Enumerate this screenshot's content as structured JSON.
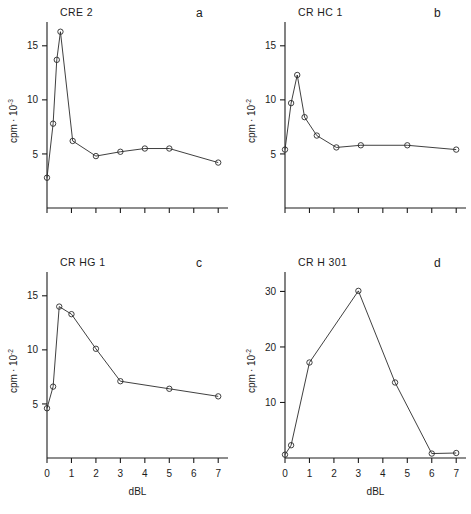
{
  "figure": {
    "background": "#ffffff",
    "ink": "#1c1c1c"
  },
  "panels": {
    "a": {
      "letter": "a",
      "title": "CRE 2",
      "ylabel_base": "cpm",
      "ylabel_mid": "· 10",
      "ylabel_exp": "-3",
      "xlabel": "",
      "yticks": [
        "5",
        "10",
        "15"
      ],
      "xticks": [
        "",
        "",
        "",
        "",
        "",
        "",
        "",
        ""
      ]
    },
    "b": {
      "letter": "b",
      "title": "CR HC 1",
      "ylabel_base": "cpm",
      "ylabel_mid": "· 10",
      "ylabel_exp": "-2",
      "xlabel": "",
      "yticks": [
        "5",
        "10",
        "15"
      ],
      "xticks": [
        "",
        "",
        "",
        "",
        "",
        "",
        "",
        ""
      ]
    },
    "c": {
      "letter": "c",
      "title": "CR HG 1",
      "ylabel_base": "cpm",
      "ylabel_mid": "· 10",
      "ylabel_exp": "-2",
      "xlabel": "dBL",
      "yticks": [
        "5",
        "10",
        "15"
      ],
      "xticks": [
        "0",
        "1",
        "2",
        "3",
        "4",
        "5",
        "6",
        "7"
      ]
    },
    "d": {
      "letter": "d",
      "title": "CR H 301",
      "ylabel_base": "cpm",
      "ylabel_mid": "· 10",
      "ylabel_exp": "-2",
      "xlabel": "dBL",
      "yticks": [
        "10",
        "20",
        "30"
      ],
      "xticks": [
        "0",
        "1",
        "2",
        "3",
        "4",
        "5",
        "6",
        "7"
      ]
    }
  },
  "chart_data": [
    {
      "type": "line",
      "panel": "a",
      "title": "CRE 2",
      "xlabel": "dBL",
      "ylabel": "cpm · 10^-3",
      "xlim": [
        0,
        7.4
      ],
      "ylim": [
        0,
        17.2
      ],
      "yticks": [
        5,
        10,
        15
      ],
      "xticks": [
        0,
        1,
        2,
        3,
        4,
        5,
        6,
        7
      ],
      "xtick_labels_shown": false,
      "grid": false,
      "legend": null,
      "markers": "open-circle",
      "x": [
        0,
        0.25,
        0.4,
        0.55,
        1.05,
        2.0,
        3.0,
        4.0,
        5.0,
        7.0
      ],
      "y": [
        2.8,
        7.8,
        13.7,
        16.3,
        6.2,
        4.8,
        5.2,
        5.5,
        5.5,
        4.2
      ]
    },
    {
      "type": "line",
      "panel": "b",
      "title": "CR HC 1",
      "xlabel": "dBL",
      "ylabel": "cpm · 10^-2",
      "xlim": [
        0,
        7.4
      ],
      "ylim": [
        0,
        17.2
      ],
      "yticks": [
        5,
        10,
        15
      ],
      "xticks": [
        0,
        1,
        2,
        3,
        4,
        5,
        6,
        7
      ],
      "xtick_labels_shown": false,
      "grid": false,
      "legend": null,
      "markers": "open-circle",
      "x": [
        0,
        0.25,
        0.5,
        0.8,
        1.3,
        2.1,
        3.1,
        5.0,
        7.0
      ],
      "y": [
        5.4,
        9.7,
        12.3,
        8.4,
        6.7,
        5.6,
        5.8,
        5.8,
        5.4
      ]
    },
    {
      "type": "line",
      "panel": "c",
      "title": "CR HG 1",
      "xlabel": "dBL",
      "ylabel": "cpm · 10^-2",
      "xlim": [
        0,
        7.4
      ],
      "ylim": [
        0,
        17.2
      ],
      "yticks": [
        5,
        10,
        15
      ],
      "xticks": [
        0,
        1,
        2,
        3,
        4,
        5,
        6,
        7
      ],
      "xtick_labels_shown": true,
      "grid": false,
      "legend": null,
      "markers": "open-circle",
      "x": [
        0,
        0.25,
        0.5,
        1.0,
        2.0,
        3.0,
        5.0,
        7.0
      ],
      "y": [
        4.6,
        6.6,
        14.0,
        13.3,
        10.1,
        7.1,
        6.4,
        5.7
      ]
    },
    {
      "type": "line",
      "panel": "d",
      "title": "CR H 301",
      "xlabel": "dBL",
      "ylabel": "cpm · 10^-2",
      "xlim": [
        0,
        7.4
      ],
      "ylim": [
        0,
        33.5
      ],
      "yticks": [
        10,
        20,
        30
      ],
      "xticks": [
        0,
        1,
        2,
        3,
        4,
        5,
        6,
        7
      ],
      "xtick_labels_shown": true,
      "grid": false,
      "legend": null,
      "markers": "open-circle",
      "x": [
        0,
        0.25,
        1.0,
        3.0,
        4.5,
        6.0,
        7.0
      ],
      "y": [
        0.6,
        2.3,
        17.2,
        30.1,
        13.6,
        0.8,
        0.9
      ]
    }
  ]
}
